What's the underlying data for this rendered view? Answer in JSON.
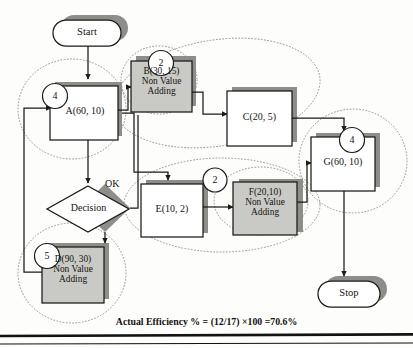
{
  "figure": {
    "type": "flowchart",
    "caption": "Actual Efficiency % = (12/17) ×100 =70.6%"
  },
  "terminals": {
    "start": "Start",
    "stop": "Stop"
  },
  "decision": {
    "label": "Decision",
    "branch_label": "OK"
  },
  "nodes": [
    {
      "id": "A",
      "label": "A(60, 10)",
      "badge": "4",
      "value_adding": true,
      "fill": "#ffffff"
    },
    {
      "id": "B",
      "label": "B(30, 15)\nNon Value\nAdding",
      "badge": "2",
      "value_adding": false,
      "fill": "#c9c9c5"
    },
    {
      "id": "C",
      "label": "C(20, 5)",
      "badge": "",
      "value_adding": true,
      "fill": "#ffffff"
    },
    {
      "id": "D",
      "label": "D(90, 30)\nNon Value\nAdding",
      "badge": "5",
      "value_adding": false,
      "fill": "#c9c9c5"
    },
    {
      "id": "E",
      "label": "E(10, 2)",
      "badge": "",
      "value_adding": true,
      "fill": "#ffffff"
    },
    {
      "id": "F",
      "label": "F(20,10)\nNon Value\nAdding",
      "badge": "2",
      "value_adding": false,
      "fill": "#c9c9c5"
    },
    {
      "id": "G",
      "label": "G(60, 10)",
      "badge": "4",
      "value_adding": true,
      "fill": "#ffffff"
    }
  ],
  "badges": {
    "a": "4",
    "b": "2",
    "d": "5",
    "f": "2",
    "g": "4"
  },
  "colors": {
    "stroke": "#1a1a16",
    "shadow": "#8d8d89",
    "non_value_fill": "#c9c9c5",
    "value_fill": "#ffffff",
    "dotted_group": "#8a8a85",
    "page_rule": "#121210"
  },
  "groups": [
    {
      "name": "group-a",
      "shape": "circle"
    },
    {
      "name": "group-bc",
      "shape": "ellipse-tilted"
    },
    {
      "name": "group-b",
      "shape": "ellipse-small"
    },
    {
      "name": "group-ef",
      "shape": "ellipse"
    },
    {
      "name": "group-f",
      "shape": "ellipse-small"
    },
    {
      "name": "group-d",
      "shape": "circle"
    },
    {
      "name": "group-g",
      "shape": "circle"
    }
  ]
}
